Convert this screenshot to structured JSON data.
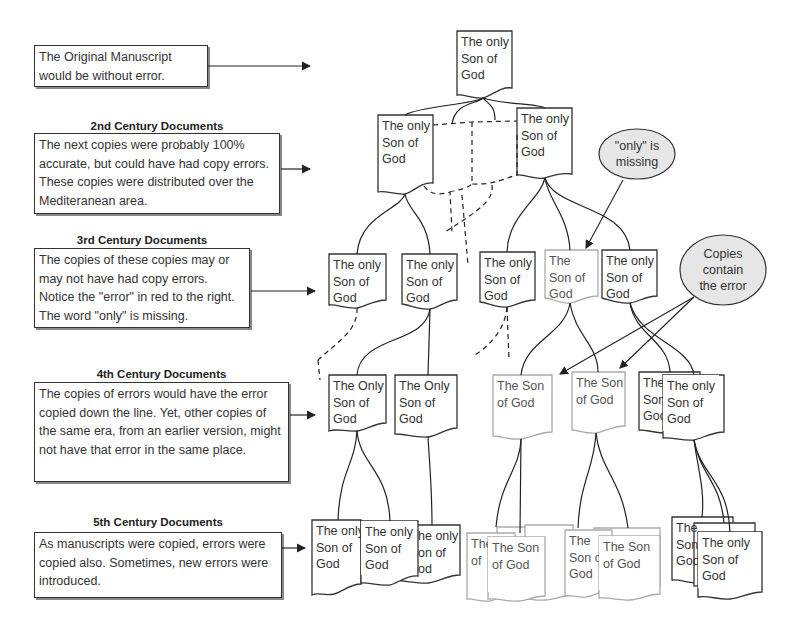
{
  "rows": [
    {
      "heading": "",
      "note": "The Original Manuscript would be without error."
    },
    {
      "heading": "2nd Century Documents",
      "note": "The next copies were probably 100% accurate, but could have had copy errors.  These copies were distributed over the Mediteranean area."
    },
    {
      "heading": "3rd Century Documents",
      "note": "The copies of these copies may or may not have had copy errors. Notice the \"error\" in red to the right.  The word \"only\" is missing."
    },
    {
      "heading": "4th Century Documents",
      "note": "The copies of errors would have the error copied down the line.  Yet, other copies of the same era, from an earlier version, might not have that error in the same place."
    },
    {
      "heading": "5th Century Documents",
      "note": "As manuscripts were copied, errors were copied also.  Sometimes, new errors were introduced."
    }
  ],
  "docs": {
    "original": "The only\nSon of\nGod",
    "c2": [
      "The only\nSon of\nGod",
      "The only\nSon of\nGod"
    ],
    "c3": [
      "The only\nSon of\nGod",
      "The only\nSon of\nGod",
      "The only\nSon of\nGod",
      "The\nSon of\nGod",
      "The only\nSon of\nGod"
    ],
    "c4": [
      "The Only\nSon of\nGod",
      "The Only\nSon of\nGod",
      "The Son\nof God",
      "The Son\nof God",
      "The\nSon\nGod",
      "The only\nSon of\nGod"
    ],
    "c5": [
      "The only\nSon of\nGod",
      "The only\nSon of\nGod",
      "he only\non of\nod",
      "The\nof",
      "The  Son\nof God",
      "The\nSon o\nGod",
      "The Son\nof God",
      "The\nSon\nGod",
      "The only\nSon of\nGod"
    ]
  },
  "callouts": {
    "missing": "\"only\" is\nmissing",
    "contain": "Copies\ncontain\nthe error"
  },
  "colors": {
    "line": "#222222",
    "error_doc": "#aaaaaa",
    "bubble_fill": "#e6e6e6"
  }
}
